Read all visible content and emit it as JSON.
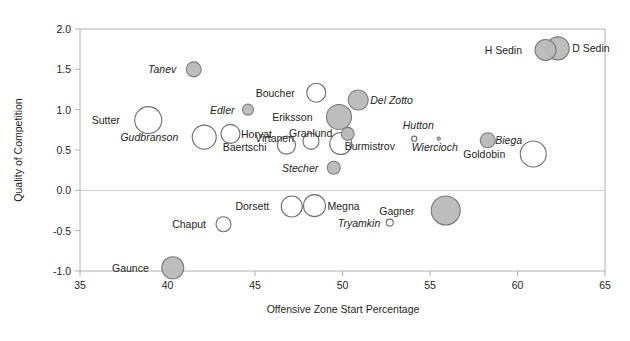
{
  "chart_data": {
    "type": "scatter",
    "title": "",
    "subtitle": "",
    "xlabel": "Offensive Zone Start Percentage",
    "ylabel": "Quality of Competition",
    "xlim": [
      35,
      65
    ],
    "ylim": [
      -1.0,
      2.0
    ],
    "xticks": [
      "35",
      "40",
      "45",
      "50",
      "55",
      "60",
      "65"
    ],
    "xtick_values": [
      35,
      40,
      45,
      50,
      55,
      60,
      65
    ],
    "yticks": [
      "2.0",
      "1.5",
      "1.0",
      "0.5",
      "0.0",
      "-0.5",
      "-1.0"
    ],
    "ytick_values": [
      2.0,
      1.5,
      1.0,
      0.5,
      0.0,
      -0.5,
      -1.0
    ],
    "grid": false,
    "legend": "none",
    "bubble_note": "Marker area encodes a third variable (time on ice); filled grey markers vs open white markers distinguish two groups.",
    "colors": {
      "filled": "#b9b9b9",
      "filled_stroke": "#7a7a7a",
      "open": "#ffffff",
      "open_stroke": "#6e6e6e",
      "axis": "#b0b0b0",
      "text": "#231f20"
    },
    "points": [
      {
        "label": "Tanev",
        "x": 41.5,
        "y": 1.5,
        "size": 7.5,
        "style": "filled",
        "italic": true,
        "anchor": "end",
        "ldx": -10,
        "ldy": 4
      },
      {
        "label": "H Sedin",
        "x": 61.6,
        "y": 1.74,
        "size": 10.5,
        "style": "filled",
        "italic": false,
        "anchor": "end",
        "ldx": -13,
        "ldy": 4
      },
      {
        "label": "D Sedin",
        "x": 62.3,
        "y": 1.76,
        "size": 11.5,
        "style": "filled",
        "italic": false,
        "anchor": "start",
        "ldx": 13,
        "ldy": 4
      },
      {
        "label": "Sutter",
        "x": 38.9,
        "y": 0.87,
        "size": 13.5,
        "style": "open",
        "italic": false,
        "anchor": "end",
        "ldx": -15,
        "ldy": 4
      },
      {
        "label": "Edler",
        "x": 44.6,
        "y": 1.0,
        "size": 5.5,
        "style": "filled",
        "italic": true,
        "anchor": "end",
        "ldx": -8,
        "ldy": 4
      },
      {
        "label": "Boucher",
        "x": 48.5,
        "y": 1.21,
        "size": 9.5,
        "style": "open",
        "italic": false,
        "anchor": "end",
        "ldx": -12,
        "ldy": 4
      },
      {
        "label": "Del Zotto",
        "x": 50.9,
        "y": 1.12,
        "size": 10.0,
        "style": "filled",
        "italic": true,
        "anchor": "start",
        "ldx": 12,
        "ldy": 4
      },
      {
        "label": "Gudbranson",
        "x": 42.1,
        "y": 0.66,
        "size": 12.0,
        "style": "open",
        "italic": true,
        "anchor": "end",
        "ldx": -14,
        "ldy": 4
      },
      {
        "label": "Horvat",
        "x": 43.6,
        "y": 0.7,
        "size": 9.5,
        "style": "open",
        "italic": false,
        "anchor": "start",
        "ldx": 11,
        "ldy": 4
      },
      {
        "label": "Eriksson",
        "x": 49.8,
        "y": 0.91,
        "size": 12.5,
        "style": "filled",
        "italic": false,
        "anchor": "end",
        "ldx": -14,
        "ldy": 4
      },
      {
        "label": "Hutton",
        "x": 54.1,
        "y": 0.64,
        "size": 2.6,
        "style": "open",
        "italic": true,
        "anchor": "mid",
        "ldx": 4,
        "ldy": -10
      },
      {
        "label": "Biega",
        "x": 58.3,
        "y": 0.62,
        "size": 7.5,
        "style": "filled",
        "italic": true,
        "anchor": "start",
        "ldx": 10,
        "ldy": 4
      },
      {
        "label": "Baertschi",
        "x": 46.8,
        "y": 0.56,
        "size": 9.0,
        "style": "open",
        "italic": false,
        "anchor": "end",
        "ldx": -11,
        "ldy": 6
      },
      {
        "label": "Virtanen",
        "x": 48.2,
        "y": 0.61,
        "size": 8.0,
        "style": "open",
        "italic": false,
        "anchor": "end",
        "ldx": -9,
        "ldy": 1
      },
      {
        "label": "Granlund",
        "x": 50.3,
        "y": 0.7,
        "size": 6.5,
        "style": "filled",
        "italic": false,
        "anchor": "end",
        "ldx": -9,
        "ldy": 3
      },
      {
        "label": "Burmistrov",
        "x": 49.9,
        "y": 0.58,
        "size": 11.0,
        "style": "open",
        "italic": false,
        "anchor": "start",
        "ldx": 3,
        "ldy": 6
      },
      {
        "label": "Wiercioch",
        "x": 55.5,
        "y": 0.64,
        "size": 1.6,
        "style": "filled",
        "italic": true,
        "anchor": "mid",
        "ldx": -4,
        "ldy": 12
      },
      {
        "label": "Goldobin",
        "x": 60.9,
        "y": 0.45,
        "size": 13.0,
        "style": "open",
        "italic": false,
        "anchor": "end",
        "ldx": -15,
        "ldy": 4
      },
      {
        "label": "Stecher",
        "x": 49.5,
        "y": 0.28,
        "size": 6.5,
        "style": "filled",
        "italic": true,
        "anchor": "end",
        "ldx": -9,
        "ldy": 4
      },
      {
        "label": "Dorsett",
        "x": 47.1,
        "y": -0.2,
        "size": 10.5,
        "style": "open",
        "italic": false,
        "anchor": "end",
        "ldx": -12,
        "ldy": 4
      },
      {
        "label": "Megna",
        "x": 48.4,
        "y": -0.19,
        "size": 11.0,
        "style": "open",
        "italic": false,
        "anchor": "start",
        "ldx": 12,
        "ldy": 4
      },
      {
        "label": "Gagner",
        "x": 55.9,
        "y": -0.25,
        "size": 14.5,
        "style": "filled",
        "italic": false,
        "anchor": "end",
        "ldx": -17,
        "ldy": 4
      },
      {
        "label": "Chaput",
        "x": 43.2,
        "y": -0.42,
        "size": 7.5,
        "style": "open",
        "italic": false,
        "anchor": "end",
        "ldx": -10,
        "ldy": 4
      },
      {
        "label": "Tryamkin",
        "x": 52.7,
        "y": -0.4,
        "size": 3.5,
        "style": "open",
        "italic": true,
        "anchor": "end",
        "ldx": -6,
        "ldy": 4
      },
      {
        "label": "Gaunce",
        "x": 40.3,
        "y": -0.96,
        "size": 11.0,
        "style": "filled",
        "italic": false,
        "anchor": "end",
        "ldx": -13,
        "ldy": 4
      }
    ]
  }
}
